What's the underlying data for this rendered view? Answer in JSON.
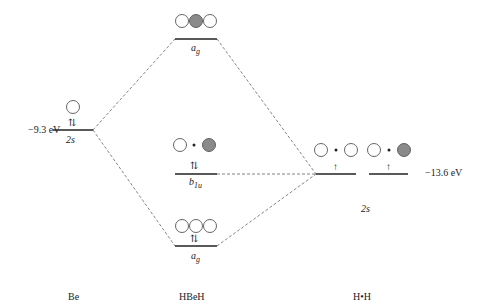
{
  "diagram": {
    "type": "molecular-orbital-diagram",
    "columns": [
      {
        "id": "be",
        "label": "Be"
      },
      {
        "id": "hbeh",
        "label": "HBeH"
      },
      {
        "id": "hh",
        "label": "H•H"
      }
    ],
    "be": {
      "energy_label": "−9.3 eV",
      "orbital_label": "2s",
      "electrons": "⇅"
    },
    "hbeh": {
      "levels": [
        {
          "id": "ag-upper",
          "symbol": "a",
          "subscript": "g",
          "electrons": "",
          "lobes": [
            "white",
            "gray",
            "white"
          ]
        },
        {
          "id": "b1u",
          "symbol": "b",
          "subscript": "1u",
          "electrons": "⇅",
          "lobes": [
            "white",
            "node",
            "gray"
          ]
        },
        {
          "id": "ag-lower",
          "symbol": "a",
          "subscript": "g",
          "electrons": "⇅",
          "lobes": [
            "white",
            "white",
            "white"
          ]
        }
      ]
    },
    "hh": {
      "energy_label": "−13.6 eV",
      "orbital_label": "2s",
      "levels": [
        {
          "id": "hh-plus",
          "electrons": "↑",
          "lobes": [
            "white",
            "node",
            "white"
          ]
        },
        {
          "id": "hh-minus",
          "electrons": "↑",
          "lobes": [
            "white",
            "node",
            "gray"
          ]
        }
      ]
    },
    "colors": {
      "line": "#222222",
      "dash": "#777777",
      "lobe_fill_gray": "#8a8a8a",
      "lobe_stroke": "#555555"
    }
  }
}
